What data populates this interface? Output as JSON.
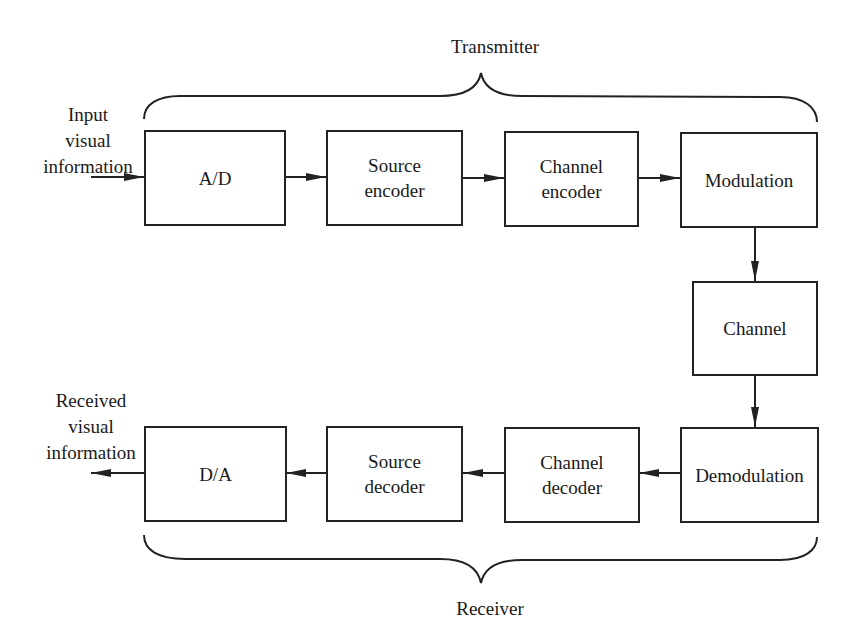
{
  "diagram": {
    "transmitter_label": "Transmitter",
    "receiver_label": "Receiver",
    "input_label": [
      "Input",
      "visual",
      "information"
    ],
    "output_label": [
      "Received",
      "visual",
      "information"
    ],
    "blocks": {
      "ad": {
        "lines": [
          "A/D"
        ]
      },
      "source_encoder": {
        "lines": [
          "Source",
          "encoder"
        ]
      },
      "channel_encoder": {
        "lines": [
          "Channel",
          "encoder"
        ]
      },
      "modulation": {
        "lines": [
          "Modulation"
        ]
      },
      "channel": {
        "lines": [
          "Channel"
        ]
      },
      "demodulation": {
        "lines": [
          "Demodulation"
        ]
      },
      "channel_decoder": {
        "lines": [
          "Channel",
          "decoder"
        ]
      },
      "source_decoder": {
        "lines": [
          "Source",
          "decoder"
        ]
      },
      "da": {
        "lines": [
          "D/A"
        ]
      }
    },
    "edges": [
      {
        "from": "input",
        "to": "A/D"
      },
      {
        "from": "A/D",
        "to": "Source encoder"
      },
      {
        "from": "Source encoder",
        "to": "Channel encoder"
      },
      {
        "from": "Channel encoder",
        "to": "Modulation"
      },
      {
        "from": "Modulation",
        "to": "Channel"
      },
      {
        "from": "Channel",
        "to": "Demodulation"
      },
      {
        "from": "Demodulation",
        "to": "Channel decoder"
      },
      {
        "from": "Channel decoder",
        "to": "Source decoder"
      },
      {
        "from": "Source decoder",
        "to": "D/A"
      },
      {
        "from": "D/A",
        "to": "output"
      }
    ],
    "colors": {
      "stroke": "#222222",
      "background": "#ffffff"
    }
  }
}
